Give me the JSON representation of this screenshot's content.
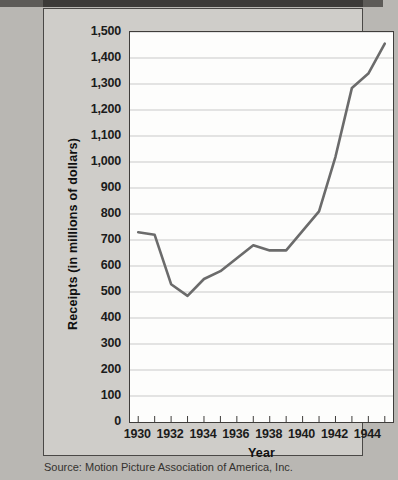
{
  "figure": {
    "source_note": "Source: Motion Picture Association of America, Inc.",
    "line_color": "#6b6b6b",
    "axis_color": "#3f3d3b",
    "grid_color": "#c9c9c9",
    "plot_background": "#fdfdfc",
    "page_background": "#b9b7b3"
  },
  "chart_data": {
    "type": "line",
    "title": "",
    "xlabel": "Year",
    "ylabel": "Receipts (in millions of dollars)",
    "xlim": [
      1929.5,
      1945.5
    ],
    "ylim": [
      0,
      1500
    ],
    "grid": true,
    "legend": "none",
    "ytick_labels": [
      "1,500",
      "1,400",
      "1,300",
      "1,200",
      "1,100",
      "1,000",
      "900",
      "800",
      "700",
      "600",
      "500",
      "400",
      "300",
      "200",
      "100",
      "0"
    ],
    "ytick_values": [
      1500,
      1400,
      1300,
      1200,
      1100,
      1000,
      900,
      800,
      700,
      600,
      500,
      400,
      300,
      200,
      100,
      0
    ],
    "xtick_labels": [
      "1930",
      "1932",
      "1934",
      "1936",
      "1938",
      "1940",
      "1942",
      "1944"
    ],
    "xtick_values": [
      1930,
      1932,
      1934,
      1936,
      1938,
      1940,
      1942,
      1944
    ],
    "minor_xticks": [
      1931,
      1933,
      1935,
      1937,
      1939,
      1941,
      1943,
      1945
    ],
    "x": [
      1930,
      1931,
      1932,
      1933,
      1934,
      1935,
      1936,
      1937,
      1938,
      1939,
      1940,
      1941,
      1942,
      1943,
      1944,
      1945
    ],
    "values": [
      730,
      720,
      530,
      485,
      550,
      580,
      630,
      680,
      660,
      660,
      735,
      810,
      1020,
      1285,
      1340,
      1455
    ],
    "series": [
      {
        "name": "Motion picture receipts",
        "values": [
          730,
          720,
          530,
          485,
          550,
          580,
          630,
          680,
          660,
          660,
          735,
          810,
          1020,
          1285,
          1340,
          1455
        ]
      }
    ]
  }
}
